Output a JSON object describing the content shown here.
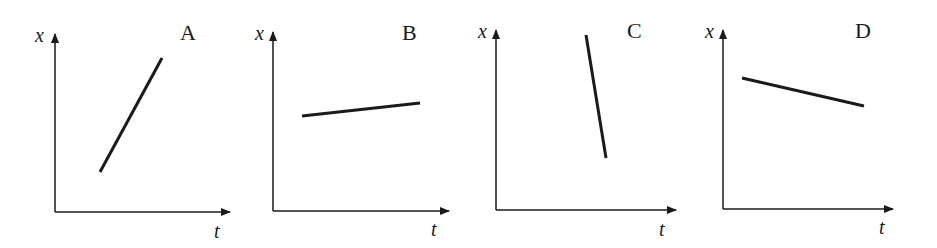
{
  "figure": {
    "colors": {
      "background": "#ffffff",
      "ink": "#1a1a1a"
    }
  },
  "panels": [
    {
      "label": "A",
      "y_axis_label": "x",
      "x_axis_label": "t",
      "origin": [
        55,
        212
      ],
      "y_axis_top": 34,
      "x_axis_right": 230,
      "line": {
        "x1": 100,
        "y1": 172,
        "x2": 162,
        "y2": 58
      },
      "slope": "steep positive"
    },
    {
      "label": "B",
      "y_axis_label": "x",
      "x_axis_label": "t",
      "origin": [
        273,
        211
      ],
      "y_axis_top": 32,
      "x_axis_right": 449,
      "line": {
        "x1": 302,
        "y1": 116,
        "x2": 420,
        "y2": 103
      },
      "slope": "shallow positive"
    },
    {
      "label": "C",
      "y_axis_label": "x",
      "x_axis_label": "t",
      "origin": [
        496,
        210
      ],
      "y_axis_top": 30,
      "x_axis_right": 676,
      "line": {
        "x1": 586,
        "y1": 35,
        "x2": 606,
        "y2": 158
      },
      "slope": "steep negative"
    },
    {
      "label": "D",
      "y_axis_label": "x",
      "x_axis_label": "t",
      "origin": [
        723,
        209
      ],
      "y_axis_top": 30,
      "x_axis_right": 893,
      "line": {
        "x1": 742,
        "y1": 78,
        "x2": 864,
        "y2": 106
      },
      "slope": "shallow negative"
    }
  ]
}
